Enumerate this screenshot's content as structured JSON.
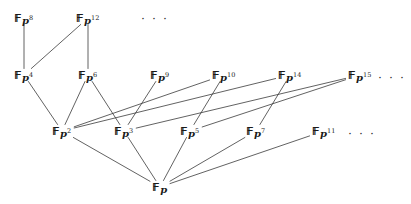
{
  "figure": {
    "width": 411,
    "height": 204,
    "background": "#ffffff",
    "line_color": "#3a3a3a",
    "text_color": "#1a1a1a",
    "ellipsis_text": "· · ·"
  },
  "chart_data": {
    "type": "diagram",
    "subtype": "hasse-lattice",
    "base_symbol": "F",
    "base_subscript": "p",
    "nodes": [
      {
        "id": "p8",
        "label_base": "F",
        "label_sub": "p",
        "exponent": "8",
        "x": 24,
        "y": 18,
        "degree": 8,
        "row": 1
      },
      {
        "id": "p12",
        "label_base": "F",
        "label_sub": "p",
        "exponent": "12",
        "x": 88,
        "y": 18,
        "degree": 12,
        "row": 1
      },
      {
        "id": "p4",
        "label_base": "F",
        "label_sub": "p",
        "exponent": "4",
        "x": 24,
        "y": 75,
        "degree": 4,
        "row": 2
      },
      {
        "id": "p6",
        "label_base": "F",
        "label_sub": "p",
        "exponent": "6",
        "x": 88,
        "y": 75,
        "degree": 6,
        "row": 2
      },
      {
        "id": "p9",
        "label_base": "F",
        "label_sub": "p",
        "exponent": "9",
        "x": 160,
        "y": 75,
        "degree": 9,
        "row": 2
      },
      {
        "id": "p10",
        "label_base": "F",
        "label_sub": "p",
        "exponent": "10",
        "x": 224,
        "y": 75,
        "degree": 10,
        "row": 2
      },
      {
        "id": "p14",
        "label_base": "F",
        "label_sub": "p",
        "exponent": "14",
        "x": 290,
        "y": 75,
        "degree": 14,
        "row": 2
      },
      {
        "id": "p15",
        "label_base": "F",
        "label_sub": "p",
        "exponent": "15",
        "x": 360,
        "y": 75,
        "degree": 15,
        "row": 2
      },
      {
        "id": "p2",
        "label_base": "F",
        "label_sub": "p",
        "exponent": "2",
        "x": 62,
        "y": 131,
        "degree": 2,
        "row": 3
      },
      {
        "id": "p3",
        "label_base": "F",
        "label_sub": "p",
        "exponent": "3",
        "x": 124,
        "y": 131,
        "degree": 3,
        "row": 3
      },
      {
        "id": "p5",
        "label_base": "F",
        "label_sub": "p",
        "exponent": "5",
        "x": 190,
        "y": 131,
        "degree": 5,
        "row": 3
      },
      {
        "id": "p7",
        "label_base": "F",
        "label_sub": "p",
        "exponent": "7",
        "x": 256,
        "y": 131,
        "degree": 7,
        "row": 3
      },
      {
        "id": "p11",
        "label_base": "F",
        "label_sub": "p",
        "exponent": "11",
        "x": 324,
        "y": 131,
        "degree": 11,
        "row": 3
      },
      {
        "id": "p1",
        "label_base": "F",
        "label_sub": "p",
        "exponent": "",
        "x": 160,
        "y": 187,
        "degree": 1,
        "row": 4
      }
    ],
    "edges": [
      {
        "from": "p8",
        "to": "p4"
      },
      {
        "from": "p12",
        "to": "p6"
      },
      {
        "from": "p12",
        "to": "p4"
      },
      {
        "from": "p4",
        "to": "p2"
      },
      {
        "from": "p6",
        "to": "p2"
      },
      {
        "from": "p6",
        "to": "p3"
      },
      {
        "from": "p9",
        "to": "p3"
      },
      {
        "from": "p10",
        "to": "p2"
      },
      {
        "from": "p10",
        "to": "p5"
      },
      {
        "from": "p14",
        "to": "p2"
      },
      {
        "from": "p14",
        "to": "p7"
      },
      {
        "from": "p15",
        "to": "p3"
      },
      {
        "from": "p15",
        "to": "p5"
      },
      {
        "from": "p2",
        "to": "p1"
      },
      {
        "from": "p3",
        "to": "p1"
      },
      {
        "from": "p5",
        "to": "p1"
      },
      {
        "from": "p7",
        "to": "p1"
      },
      {
        "from": "p11",
        "to": "p1"
      }
    ],
    "ellipses": [
      {
        "id": "ellipsis-row1",
        "x": 155,
        "y": 19
      },
      {
        "id": "ellipsis-row2",
        "x": 392,
        "y": 78
      },
      {
        "id": "ellipsis-row3",
        "x": 362,
        "y": 134
      }
    ]
  }
}
